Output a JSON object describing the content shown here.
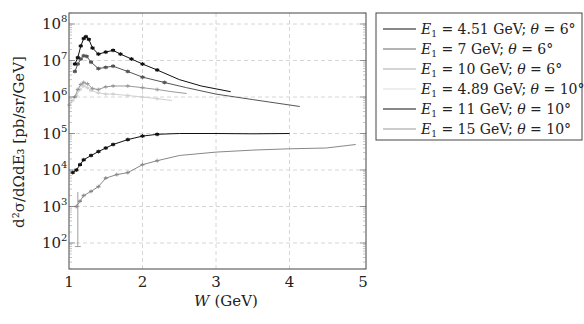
{
  "chart_data": {
    "type": "line",
    "title": "",
    "xlabel": "W (GeV)",
    "ylabel": "d²σ/dΩdE₃ [pb/sr/GeV]",
    "xlim": [
      1,
      5
    ],
    "ylim": [
      20,
      150000000
    ],
    "yscale": "log",
    "xticks": [
      "1",
      "2",
      "3",
      "4",
      "5"
    ],
    "yticks": [
      "10^2",
      "10^3",
      "10^4",
      "10^5",
      "10^6",
      "10^7",
      "10^8"
    ],
    "grid": true,
    "legend_position": "outside-right",
    "series": [
      {
        "name": "E1 = 4.51 GeV; θ = 6°",
        "color": "#111111",
        "x": [
          1.08,
          1.12,
          1.16,
          1.2,
          1.23,
          1.27,
          1.32,
          1.4,
          1.5,
          1.6,
          1.7,
          1.85,
          2.0,
          2.2,
          2.5,
          2.8,
          3.2
        ],
        "y": [
          8000000,
          12000000,
          25000000,
          40000000,
          45000000,
          38000000,
          22000000,
          15000000,
          17000000,
          19000000,
          15000000,
          11000000,
          8000000,
          5500000,
          3000000,
          2000000,
          1400000
        ]
      },
      {
        "name": "E1 = 7 GeV; θ = 6°",
        "color": "#555555",
        "x": [
          1.08,
          1.12,
          1.16,
          1.2,
          1.24,
          1.3,
          1.4,
          1.5,
          1.6,
          1.8,
          2.0,
          2.3,
          2.6,
          3.0,
          3.5,
          4.14
        ],
        "y": [
          5000000,
          8000000,
          11000000,
          13500000,
          13000000,
          9000000,
          6000000,
          6500000,
          7000000,
          5000000,
          3500000,
          2500000,
          1800000,
          1200000,
          850000,
          550000
        ]
      },
      {
        "name": "E1 = 10 GeV; θ = 6°",
        "color": "#999999",
        "x": [
          1.08,
          1.12,
          1.16,
          1.2,
          1.25,
          1.32,
          1.4,
          1.5,
          1.6,
          1.8,
          2.0,
          2.2,
          2.4,
          2.6
        ],
        "y": [
          1000000,
          1600000,
          2200000,
          2500000,
          2300000,
          1700000,
          1600000,
          1900000,
          2000000,
          2000000,
          1800000,
          1600000,
          1400000,
          1250000
        ]
      },
      {
        "name": "E1 = 4.89 GeV; θ = 10°",
        "color": "#d0d0d0",
        "x": [
          1.0,
          1.05,
          1.1,
          1.15,
          1.2,
          1.25,
          1.3,
          1.4,
          1.5,
          1.6,
          1.8,
          2.0,
          2.2,
          2.4
        ],
        "y": [
          600000,
          800000,
          1100000,
          1600000,
          2000000,
          1800000,
          1500000,
          1300000,
          1200000,
          1200000,
          1100000,
          1000000,
          900000,
          800000
        ]
      },
      {
        "name": "E1 = 11 GeV; θ = 10°",
        "color": "#111111",
        "x": [
          1.05,
          1.1,
          1.15,
          1.2,
          1.3,
          1.4,
          1.5,
          1.6,
          1.8,
          2.0,
          2.2,
          2.5,
          3.0,
          3.5,
          4.0
        ],
        "y": [
          8500,
          10000,
          14000,
          19000,
          25000,
          32000,
          40000,
          50000,
          68000,
          85000,
          95000,
          100000,
          100000,
          98000,
          100000
        ]
      },
      {
        "name": "E1 = 15 GeV; θ = 10°",
        "color": "#888888",
        "x": [
          1.1,
          1.15,
          1.2,
          1.3,
          1.4,
          1.5,
          1.65,
          1.8,
          2.0,
          2.2,
          2.5,
          3.0,
          3.5,
          4.0,
          4.5,
          4.9
        ],
        "y": [
          1000,
          1400,
          2000,
          2600,
          3500,
          6000,
          7500,
          8500,
          14000,
          18000,
          25000,
          31000,
          35000,
          38000,
          40000,
          50000
        ]
      }
    ]
  },
  "axes": {
    "xlabel_var": "W",
    "xlabel_unit": "(GeV)",
    "ylabel": "d²σ/dΩdE₃ [pb/sr/GeV]",
    "xticks": [
      "1",
      "2",
      "3",
      "4",
      "5"
    ],
    "yticks": [
      {
        "base": "10",
        "exp": "8"
      },
      {
        "base": "10",
        "exp": "7"
      },
      {
        "base": "10",
        "exp": "6"
      },
      {
        "base": "10",
        "exp": "5"
      },
      {
        "base": "10",
        "exp": "4"
      },
      {
        "base": "10",
        "exp": "3"
      },
      {
        "base": "10",
        "exp": "2"
      }
    ]
  },
  "legend": {
    "entries": [
      {
        "e": "4.51",
        "theta": "6°",
        "color": "#111111"
      },
      {
        "e": "7",
        "theta": "6°",
        "color": "#666666"
      },
      {
        "e": "10",
        "theta": "6°",
        "color": "#aaaaaa"
      },
      {
        "e": "4.89",
        "theta": "10°",
        "color": "#dddddd"
      },
      {
        "e": "11",
        "theta": "10°",
        "color": "#111111"
      },
      {
        "e": "15",
        "theta": "10°",
        "color": "#999999"
      }
    ],
    "prefix": "E",
    "sub": "1",
    "unit": "GeV;",
    "theta_label": "θ ="
  }
}
